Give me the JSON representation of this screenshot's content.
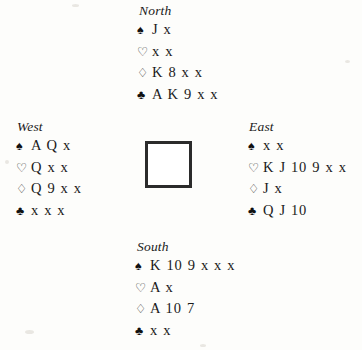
{
  "diagram": {
    "type": "bridge-deal",
    "suit_glyphs": {
      "spade": "♠",
      "heart": "♡",
      "diamond": "♢",
      "club": "♣"
    },
    "center": {
      "name": "center-square",
      "content": ""
    }
  },
  "hands": {
    "north": {
      "label": "North",
      "spades": "J x",
      "hearts": "x x",
      "diamonds": "K 8 x x",
      "clubs": "A K 9 x x"
    },
    "west": {
      "label": "West",
      "spades": "A Q x",
      "hearts": "Q x x",
      "diamonds": "Q 9 x x",
      "clubs": "x x x"
    },
    "east": {
      "label": "East",
      "spades": "x x",
      "hearts": "K J 10 9 x x",
      "diamonds": "J x",
      "clubs": "Q J 10"
    },
    "south": {
      "label": "South",
      "spades": "K 10 9 x x x",
      "hearts": "A x",
      "diamonds": "A 10 7",
      "clubs": "x x"
    }
  }
}
